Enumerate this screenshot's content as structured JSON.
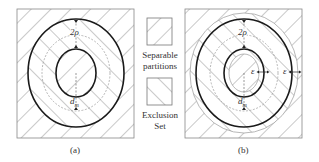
{
  "panels": [
    {
      "id": "a",
      "caption": "(a)",
      "labels": {
        "gap": "2ρ",
        "dist": "d",
        "dist_sub": "m"
      }
    },
    {
      "id": "b",
      "caption": "(b)",
      "labels": {
        "gap": "2ρ",
        "dist": "d",
        "dist_sub": "m",
        "eps_inner": "ε",
        "eps_outer": "ε"
      }
    }
  ],
  "legend": {
    "items": [
      {
        "label_line1": "Separable",
        "label_line2": "partitions",
        "hatch": "backslash"
      },
      {
        "label_line1": "Exclusion",
        "label_line2": "Set",
        "hatch": "slash"
      }
    ]
  },
  "colors": {
    "stroke": "#222222",
    "hatch": "#666666",
    "guide": "#888888",
    "background": "#ffffff"
  }
}
